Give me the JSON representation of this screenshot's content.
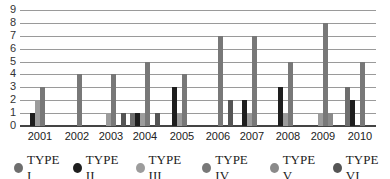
{
  "chart_data": {
    "type": "bar",
    "title": "",
    "xlabel": "",
    "ylabel": "",
    "ylim": [
      0,
      9
    ],
    "yticks": [
      0,
      1,
      2,
      3,
      4,
      5,
      6,
      7,
      8,
      9
    ],
    "grid": true,
    "legend_position": "bottom",
    "categories": [
      "2001",
      "2002",
      "2003",
      "2004",
      "2005",
      "2006",
      "2007",
      "2008",
      "2009",
      "2010"
    ],
    "series": [
      {
        "name": "TYPE I",
        "color": "#6e6e6e",
        "values": [
          0,
          0,
          0,
          1,
          0,
          0,
          0,
          0,
          0,
          3
        ]
      },
      {
        "name": "TYPE II",
        "color": "#1e1e1e",
        "values": [
          1,
          0,
          0,
          1,
          3,
          0,
          2,
          3,
          0,
          2
        ]
      },
      {
        "name": "TYPE III",
        "color": "#9c9c9c",
        "values": [
          2,
          0,
          1,
          1,
          1,
          0,
          1,
          1,
          1,
          0
        ]
      },
      {
        "name": "TYPE IV",
        "color": "#787878",
        "values": [
          3,
          4,
          4,
          5,
          4,
          7,
          7,
          5,
          8,
          5
        ]
      },
      {
        "name": "TYPE V",
        "color": "#8a8a8a",
        "values": [
          0,
          0,
          0,
          0,
          0,
          0,
          0,
          0,
          1,
          0
        ]
      },
      {
        "name": "TYPE VI",
        "color": "#555555",
        "values": [
          0,
          0,
          1,
          1,
          0,
          2,
          0,
          0,
          0,
          0
        ]
      }
    ]
  },
  "legend": {
    "items": [
      {
        "label": "TYPE I",
        "color": "#6e6e6e"
      },
      {
        "label": "TYPE II",
        "color": "#1e1e1e"
      },
      {
        "label": "TYPE III",
        "color": "#9c9c9c"
      },
      {
        "label": "TYPE IV",
        "color": "#787878"
      },
      {
        "label": "TYPE V",
        "color": "#8a8a8a"
      },
      {
        "label": "TYPE VI",
        "color": "#555555"
      }
    ]
  }
}
